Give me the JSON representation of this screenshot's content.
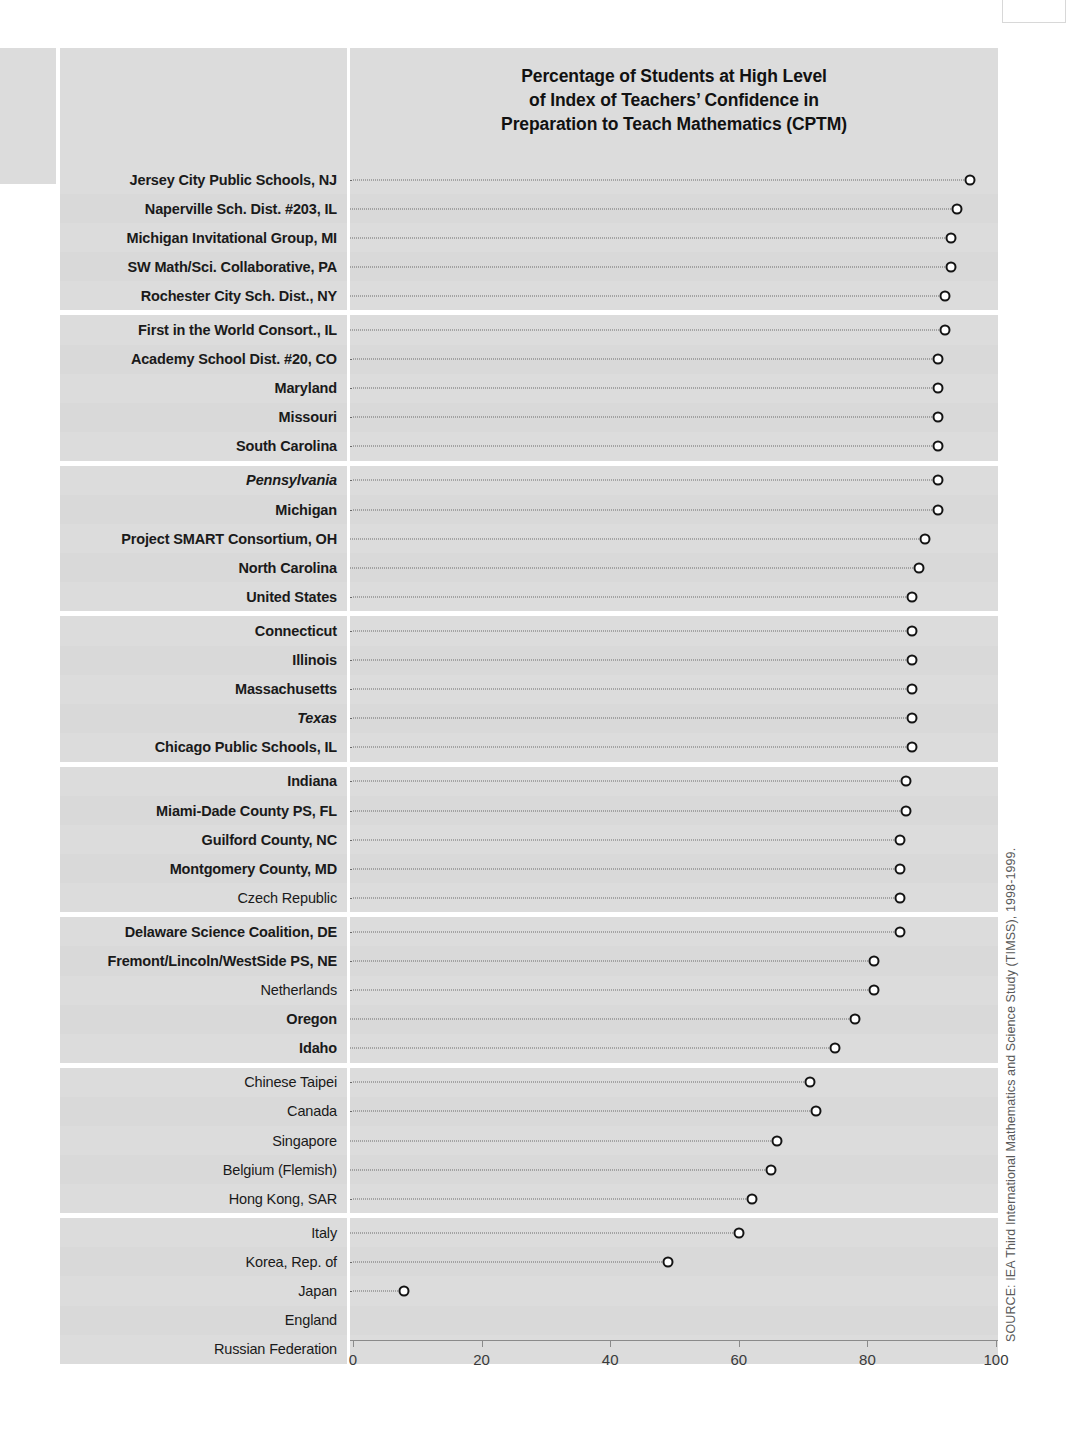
{
  "chart_data": {
    "type": "scatter",
    "title": "Percentage of Students at High Level of Index of Teachers’ Confidence in Preparation to Teach Mathematics (CPTM)",
    "title_lines": [
      "Percentage of Students at High Level",
      "of Index of Teachers’ Confidence in",
      "Preparation to Teach Mathematics (CPTM)"
    ],
    "xlabel": "",
    "ylabel": "",
    "xlim": [
      0,
      100
    ],
    "ticks": [
      0,
      20,
      40,
      60,
      80,
      100
    ],
    "tick_labels": [
      "0",
      "20",
      "40",
      "60",
      "80",
      "100"
    ],
    "grid": false,
    "legend": false,
    "orientation": "horizontal",
    "marker": "open-circle",
    "leader_line": "dotted",
    "source": "SOURCE: IEA Third International Mathematics and Science Study (TIMSS), 1998-1999.",
    "groups": [
      {
        "rows": [
          {
            "label": "Jersey City Public Schools, NJ",
            "value": 96,
            "style": "bold"
          },
          {
            "label": "Naperville Sch. Dist. #203, IL",
            "value": 94,
            "style": "bold"
          },
          {
            "label": "Michigan Invitational Group, MI",
            "value": 93,
            "style": "bold"
          },
          {
            "label": "SW Math/Sci. Collaborative, PA",
            "value": 93,
            "style": "bold"
          },
          {
            "label": "Rochester City Sch. Dist., NY",
            "value": 92,
            "style": "bold"
          }
        ]
      },
      {
        "rows": [
          {
            "label": "First in the World Consort., IL",
            "value": 92,
            "style": "bold"
          },
          {
            "label": "Academy School Dist. #20, CO",
            "value": 91,
            "style": "bold"
          },
          {
            "label": "Maryland",
            "value": 91,
            "style": "bold"
          },
          {
            "label": "Missouri",
            "value": 91,
            "style": "bold"
          },
          {
            "label": "South Carolina",
            "value": 91,
            "style": "bold"
          }
        ]
      },
      {
        "rows": [
          {
            "label": "Pennsylvania",
            "value": 91,
            "style": "italic"
          },
          {
            "label": "Michigan",
            "value": 91,
            "style": "bold"
          },
          {
            "label": "Project SMART Consortium, OH",
            "value": 89,
            "style": "bold"
          },
          {
            "label": "North Carolina",
            "value": 88,
            "style": "bold"
          },
          {
            "label": "United States",
            "value": 87,
            "style": "us"
          }
        ]
      },
      {
        "rows": [
          {
            "label": "Connecticut",
            "value": 87,
            "style": "bold"
          },
          {
            "label": "Illinois",
            "value": 87,
            "style": "bold"
          },
          {
            "label": "Massachusetts",
            "value": 87,
            "style": "bold"
          },
          {
            "label": "Texas",
            "value": 87,
            "style": "italic"
          },
          {
            "label": "Chicago Public Schools, IL",
            "value": 87,
            "style": "bold"
          }
        ]
      },
      {
        "rows": [
          {
            "label": "Indiana",
            "value": 86,
            "style": "bold"
          },
          {
            "label": "Miami-Dade County PS, FL",
            "value": 86,
            "style": "bold"
          },
          {
            "label": "Guilford County, NC",
            "value": 85,
            "style": "bold"
          },
          {
            "label": "Montgomery County, MD",
            "value": 85,
            "style": "bold"
          },
          {
            "label": "Czech Republic",
            "value": 85,
            "style": "country"
          }
        ]
      },
      {
        "rows": [
          {
            "label": "Delaware Science Coalition, DE",
            "value": 85,
            "style": "bold"
          },
          {
            "label": "Fremont/Lincoln/WestSide PS, NE",
            "value": 81,
            "style": "bold"
          },
          {
            "label": "Netherlands",
            "value": 81,
            "style": "country"
          },
          {
            "label": "Oregon",
            "value": 78,
            "style": "bold"
          },
          {
            "label": "Idaho",
            "value": 75,
            "style": "bold"
          }
        ]
      },
      {
        "rows": [
          {
            "label": "Chinese Taipei",
            "value": 71,
            "style": "country"
          },
          {
            "label": "Canada",
            "value": 72,
            "style": "country"
          },
          {
            "label": "Singapore",
            "value": 66,
            "style": "country"
          },
          {
            "label": "Belgium (Flemish)",
            "value": 65,
            "style": "country"
          },
          {
            "label": "Hong Kong, SAR",
            "value": 62,
            "style": "country"
          }
        ]
      },
      {
        "rows": [
          {
            "label": "Italy",
            "value": 60,
            "style": "country"
          },
          {
            "label": "Korea, Rep. of",
            "value": 49,
            "style": "country"
          },
          {
            "label": "Japan",
            "value": 8,
            "style": "country"
          },
          {
            "label": "England",
            "value": null,
            "style": "country"
          },
          {
            "label": "Russian Federation",
            "value": null,
            "style": "country"
          }
        ]
      }
    ]
  }
}
